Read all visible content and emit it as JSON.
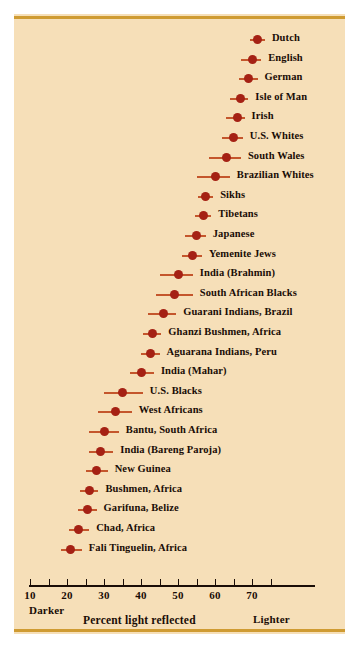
{
  "chart_data": {
    "type": "scatter",
    "title": "",
    "xlabel": "Percent light reflected",
    "ylabel": "",
    "xlim": [
      8,
      85
    ],
    "grid": false,
    "legend": "none",
    "axis_annotations": {
      "left": "Darker",
      "right": "Lighter"
    },
    "xticks": [
      10,
      15,
      20,
      25,
      30,
      35,
      40,
      45,
      50,
      55,
      60,
      65,
      70,
      75
    ],
    "xtick_labels": [
      {
        "value": 10,
        "label": "10"
      },
      {
        "value": 15,
        "label": ""
      },
      {
        "value": 20,
        "label": "20"
      },
      {
        "value": 25,
        "label": ""
      },
      {
        "value": 30,
        "label": "30"
      },
      {
        "value": 35,
        "label": ""
      },
      {
        "value": 40,
        "label": "40"
      },
      {
        "value": 45,
        "label": ""
      },
      {
        "value": 50,
        "label": "50"
      },
      {
        "value": 55,
        "label": ""
      },
      {
        "value": 60,
        "label": "60"
      },
      {
        "value": 65,
        "label": ""
      },
      {
        "value": 70,
        "label": "70"
      },
      {
        "value": 75,
        "label": ""
      }
    ],
    "marker_color": "#a52114",
    "line_color": "#c4562c",
    "background_color": "#f6dfb8",
    "rule_color": "#cf9b32",
    "text_color": "#1a0d06",
    "categories": [
      "Dutch",
      "English",
      "German",
      "Isle of Man",
      "Irish",
      "U.S. Whites",
      "South Wales",
      "Brazilian Whites",
      "Sikhs",
      "Tibetans",
      "Japanese",
      "Yemenite Jews",
      "India (Brahmin)",
      "South African Blacks",
      "Guarani Indians, Brazil",
      "Ghanzi Bushmen, Africa",
      "Aguarana Indians, Peru",
      "India (Mahar)",
      "U.S. Blacks",
      "West Africans",
      "Bantu, South Africa",
      "India (Bareng Paroja)",
      "New Guinea",
      "Bushmen, Africa",
      "Garifuna, Belize",
      "Chad, Africa",
      "Fali Tinguelin, Africa"
    ],
    "values": [
      71.5,
      70.0,
      69.0,
      67.0,
      66.0,
      65.0,
      63.0,
      60.0,
      57.5,
      57.0,
      55.0,
      54.0,
      50.0,
      49.0,
      46.0,
      43.0,
      42.5,
      40.0,
      35.0,
      33.0,
      30.0,
      29.0,
      28.0,
      26.0,
      25.5,
      23.0,
      21.0
    ],
    "ranges": [
      {
        "low": 69.5,
        "high": 73.5
      },
      {
        "low": 67.0,
        "high": 72.5
      },
      {
        "low": 66.5,
        "high": 71.5
      },
      {
        "low": 64.0,
        "high": 69.0
      },
      {
        "low": 63.0,
        "high": 68.0
      },
      {
        "low": 62.0,
        "high": 67.5
      },
      {
        "low": 58.5,
        "high": 67.0
      },
      {
        "low": 55.0,
        "high": 64.0
      },
      {
        "low": 55.5,
        "high": 59.5
      },
      {
        "low": 54.5,
        "high": 59.0
      },
      {
        "low": 52.0,
        "high": 57.5
      },
      {
        "low": 51.0,
        "high": 56.5
      },
      {
        "low": 45.0,
        "high": 54.0
      },
      {
        "low": 44.0,
        "high": 54.0
      },
      {
        "low": 42.0,
        "high": 49.5
      },
      {
        "low": 40.5,
        "high": 45.5
      },
      {
        "low": 40.0,
        "high": 45.0
      },
      {
        "low": 37.0,
        "high": 43.5
      },
      {
        "low": 30.0,
        "high": 40.5
      },
      {
        "low": 28.5,
        "high": 37.5
      },
      {
        "low": 26.0,
        "high": 34.0
      },
      {
        "low": 26.0,
        "high": 32.5
      },
      {
        "low": 25.0,
        "high": 31.0
      },
      {
        "low": 23.5,
        "high": 28.5
      },
      {
        "low": 23.0,
        "high": 28.0
      },
      {
        "low": 20.5,
        "high": 26.0
      },
      {
        "low": 18.5,
        "high": 24.0
      }
    ]
  }
}
